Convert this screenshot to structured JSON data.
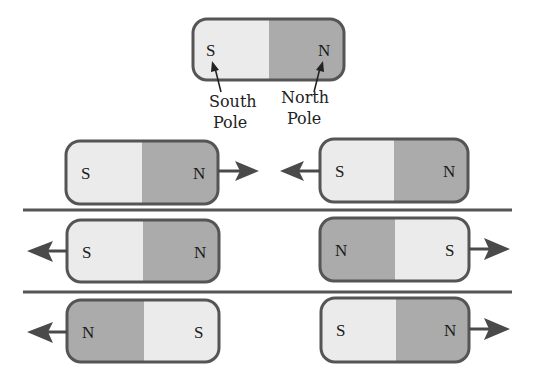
{
  "colors": {
    "south_fill": "#ebebeb",
    "north_fill": "#ababab",
    "border": "#555555",
    "arrow": "#4a4a4a",
    "divider": "#555555"
  },
  "legend": {
    "magnet": {
      "left": "S",
      "right": "N"
    },
    "south_label_line1": "South",
    "south_label_line2": "Pole",
    "north_label_line1": "North",
    "north_label_line2": "Pole"
  },
  "rows": [
    {
      "left_magnet": {
        "left": "S",
        "right": "N",
        "arrow": "right"
      },
      "right_magnet": {
        "left": "S",
        "right": "N",
        "arrow": "left"
      }
    },
    {
      "left_magnet": {
        "left": "S",
        "right": "N",
        "arrow": "left"
      },
      "right_magnet": {
        "left": "N",
        "right": "S",
        "arrow": "right"
      }
    },
    {
      "left_magnet": {
        "left": "N",
        "right": "S",
        "arrow": "left"
      },
      "right_magnet": {
        "left": "S",
        "right": "N",
        "arrow": "right"
      }
    }
  ]
}
